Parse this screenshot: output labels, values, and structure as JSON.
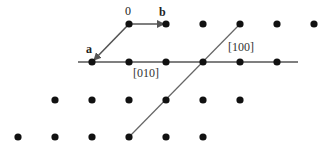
{
  "diagram": {
    "title": "",
    "lattice_rows": [
      {
        "y": 24,
        "xs": [
          129,
          166,
          203,
          240,
          277,
          314
        ]
      },
      {
        "y": 62,
        "xs": [
          92,
          129,
          166,
          203,
          240,
          277
        ]
      },
      {
        "y": 100,
        "xs": [
          55,
          92,
          129,
          166,
          203,
          240
        ]
      },
      {
        "y": 137,
        "xs": [
          18,
          55,
          92,
          129,
          166,
          203
        ]
      }
    ],
    "labels": {
      "origin": "0",
      "vector_a": "a",
      "vector_b": "b",
      "direction_010": "[010]",
      "direction_100": "[100]"
    },
    "colors": {
      "dot": "#111111",
      "line": "#555555",
      "arrow": "#555555"
    }
  }
}
